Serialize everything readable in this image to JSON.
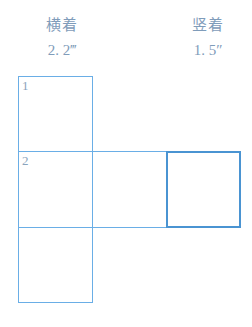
{
  "headers": {
    "left": {
      "title": "横着",
      "value": "2. 2‴"
    },
    "right": {
      "title": "竖着",
      "value": "1. 5″"
    }
  },
  "grid": {
    "rows": 3,
    "cols": 3,
    "cells": [
      {
        "row": 0,
        "col": 0,
        "label": "1",
        "selected": false
      },
      {
        "row": 1,
        "col": 0,
        "label": "2",
        "selected": false
      },
      {
        "row": 1,
        "col": 1,
        "label": "",
        "selected": false
      },
      {
        "row": 1,
        "col": 2,
        "label": "",
        "selected": true
      },
      {
        "row": 2,
        "col": 0,
        "label": "",
        "selected": false
      }
    ]
  },
  "colors": {
    "border": "#6aaee6",
    "selected_border": "#4a94d2",
    "text": "#7f9cba"
  }
}
